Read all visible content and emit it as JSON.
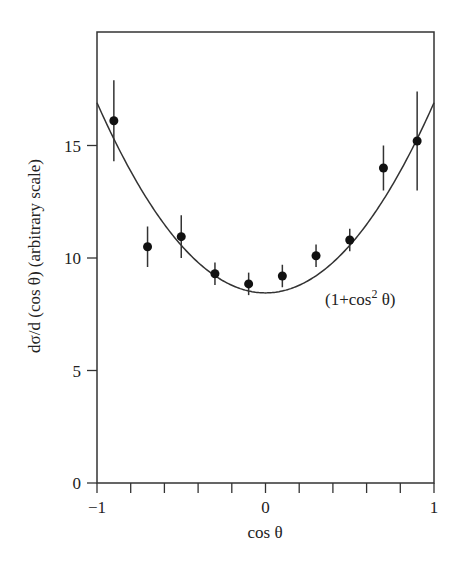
{
  "chart_data": {
    "type": "scatter",
    "title": "",
    "xlabel": "cos θ",
    "ylabel": "dσ/d (cos θ) (arbitrary scale)",
    "xlim": [
      -1,
      1
    ],
    "ylim": [
      0,
      19.1
    ],
    "grid": false,
    "legend": "none",
    "x_ticks": [
      -1,
      -0.8,
      -0.6,
      -0.4,
      -0.2,
      0,
      0.2,
      0.4,
      0.6,
      0.8,
      1
    ],
    "x_tick_labels": [
      "−1",
      "0",
      "1"
    ],
    "x_tick_label_values": [
      -1,
      0,
      1
    ],
    "y_ticks": [
      0,
      5,
      10,
      15
    ],
    "y_tick_labels": [
      "0",
      "5",
      "10",
      "15"
    ],
    "series": [
      {
        "name": "data",
        "style": "points-with-error-bars",
        "x": [
          -0.9,
          -0.7,
          -0.5,
          -0.3,
          -0.1,
          0.1,
          0.3,
          0.5,
          0.7,
          0.9
        ],
        "y": [
          16.1,
          10.5,
          10.95,
          9.3,
          8.85,
          9.2,
          10.1,
          10.8,
          14.0,
          15.2
        ],
        "yerr": [
          1.8,
          0.9,
          0.95,
          0.5,
          0.5,
          0.5,
          0.5,
          0.5,
          1.0,
          2.2
        ]
      },
      {
        "name": "fit",
        "style": "line",
        "formula": "A(1+cos²θ)",
        "A": 8.45
      }
    ],
    "annotations": [
      {
        "text": "(1+cos² θ)",
        "x": 0.62,
        "y": 8.1
      }
    ]
  },
  "labels": {
    "xlabel": "cos θ",
    "ylabel": "dσ/d (cos θ) (arbitrary scale)",
    "annotation_main": "(1+cos",
    "annotation_sup": "2",
    "annotation_end": " θ)"
  }
}
